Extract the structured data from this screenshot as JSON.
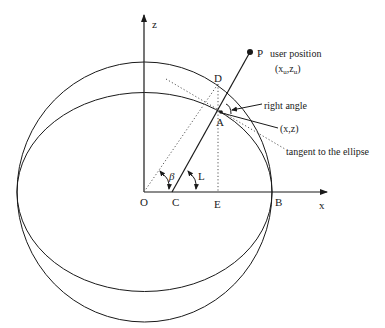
{
  "diagram": {
    "axes": {
      "x_label": "x",
      "z_label": "z"
    },
    "points": {
      "O": "O",
      "C": "C",
      "E": "E",
      "B": "B",
      "D": "D",
      "A": "A",
      "P": "P"
    },
    "angles": {
      "beta": "β",
      "L": "L"
    },
    "annotations": {
      "user_position": "user position",
      "user_coords_open": "(x",
      "user_coords_sub_u1": "u",
      "user_coords_mid": ",z",
      "user_coords_sub_u2": "u",
      "user_coords_close": ")",
      "right_angle": "right angle",
      "point_xz": "(x,z)",
      "tangent": "tangent to the ellipse"
    },
    "colors": {
      "line": "#1a1a1a",
      "dotted": "#555555",
      "background": "#ffffff"
    }
  }
}
